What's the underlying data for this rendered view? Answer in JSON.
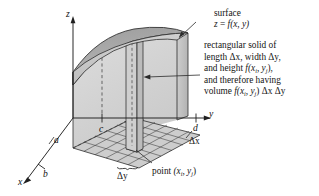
{
  "figure": {
    "surface_fill_top": "#a8a8a8",
    "surface_fill_front": "#c9c9c9",
    "solid_fill": "#d7d7d7",
    "grid_fill": "#cfcfcf",
    "line_color": "#2b2b2b"
  },
  "annotations": {
    "surface_label": {
      "line1": "surface",
      "line2_prefix": "z",
      "line2_eq": " = ",
      "line2_fn": "f",
      "line2_args": "(x, y)"
    },
    "solid_label": {
      "line1": "rectangular solid of",
      "line2a": "length ",
      "line2b": "Δx",
      "line2c": ", width ",
      "line2d": "Δy",
      "line2e": ",",
      "line3a": "and height ",
      "line3f": "f",
      "line3args_open": "(x",
      "line3sub_i": "i",
      "line3comma": ", y",
      "line3sub_j": "j",
      "line3close": "),",
      "line4": "and therefore having",
      "line5a": "volume ",
      "line5f": "f",
      "line5open": "(x",
      "line5sub_i": "i",
      "line5comma": ", y",
      "line5sub_j": "j",
      "line5close": ") ",
      "line5dx": "Δx",
      "line5sp": " ",
      "line5dy": "Δy"
    },
    "point_label": {
      "prefix": "point ",
      "open": "(x",
      "sub_i": "i",
      "comma": ", y",
      "sub_j": "j",
      "close": ")"
    },
    "delta_x": "Δx",
    "delta_y": "Δy"
  },
  "axes": {
    "z_label": "z",
    "y_label": "y",
    "x_label": "x",
    "tick_a": "a",
    "tick_b": "b",
    "tick_c": "c",
    "tick_d": "d"
  }
}
